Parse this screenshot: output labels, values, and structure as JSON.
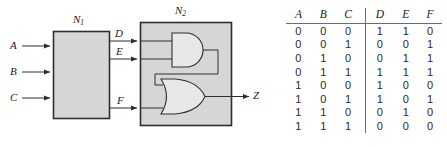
{
  "figure": {
    "blocks": [
      {
        "name": "N1",
        "label": "N",
        "sub": "1"
      },
      {
        "name": "N2",
        "label": "N",
        "sub": "2"
      }
    ],
    "inputs": [
      {
        "name": "A",
        "label": "A"
      },
      {
        "name": "B",
        "label": "B"
      },
      {
        "name": "C",
        "label": "C"
      }
    ],
    "intermediates": [
      {
        "name": "D",
        "label": "D"
      },
      {
        "name": "E",
        "label": "E"
      },
      {
        "name": "F",
        "label": "F"
      }
    ],
    "output": {
      "name": "Z",
      "label": "Z"
    },
    "gates": [
      {
        "name": "and-gate",
        "type": "AND"
      },
      {
        "name": "or-gate",
        "type": "OR"
      }
    ],
    "colors": {
      "block_fill": "#d6d6d6",
      "gate_fill": "#e3e3e3",
      "line": "#3a3a3a",
      "rule": "#6b6b6b"
    }
  },
  "truth_table": {
    "headers": [
      "A",
      "B",
      "C",
      "D",
      "E",
      "F"
    ],
    "rows": [
      [
        "0",
        "0",
        "0",
        "1",
        "1",
        "0"
      ],
      [
        "0",
        "0",
        "1",
        "0",
        "0",
        "1"
      ],
      [
        "0",
        "1",
        "0",
        "0",
        "1",
        "1"
      ],
      [
        "0",
        "1",
        "1",
        "1",
        "1",
        "1"
      ],
      [
        "1",
        "0",
        "0",
        "1",
        "0",
        "0"
      ],
      [
        "1",
        "0",
        "1",
        "1",
        "0",
        "1"
      ],
      [
        "1",
        "1",
        "0",
        "0",
        "1",
        "0"
      ],
      [
        "1",
        "1",
        "1",
        "0",
        "0",
        "0"
      ]
    ]
  }
}
